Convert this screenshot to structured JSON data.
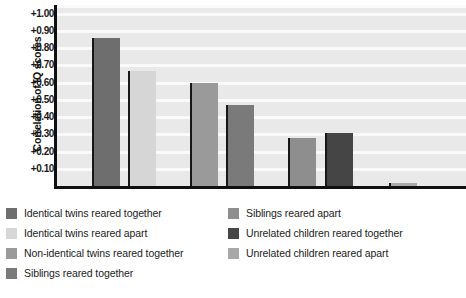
{
  "chart_data": {
    "type": "bar",
    "title": "",
    "xlabel": "",
    "ylabel": "Correlation of IQ scores",
    "ylim": [
      0.0,
      1.05
    ],
    "grid": true,
    "legend_position": "bottom",
    "ytick_labels": [
      "+1.00",
      "+0.90",
      "+0.80",
      "+0.70",
      "+0.60",
      "+0.50",
      "+0.40",
      "+0.30",
      "+0.20",
      "+0.10"
    ],
    "ytick_values": [
      1.0,
      0.9,
      0.8,
      0.7,
      0.6,
      0.5,
      0.4,
      0.3,
      0.2,
      0.1
    ],
    "categories": [
      "Identical twins reared together",
      "Identical twins reared apart",
      "Non-identical twins reared together",
      "Siblings reared together",
      "Siblings reared apart",
      "Unrelated children reared together",
      "Unrelated children reared apart"
    ],
    "values": [
      0.86,
      0.67,
      0.6,
      0.47,
      0.28,
      0.31,
      0.02
    ],
    "colors": [
      "#6e6e6e",
      "#d6d6d6",
      "#9a9a9a",
      "#7a7a7a",
      "#8e8e8e",
      "#454545",
      "#a8a8a8"
    ],
    "bar_x_px": [
      92,
      128,
      190,
      226,
      288,
      325,
      389
    ],
    "bar_w_px": [
      28,
      28,
      28,
      28,
      28,
      28,
      28
    ],
    "plot_bg": "#e9e9e9",
    "gridline_color": "#fafafa",
    "axis_color": "#101010"
  },
  "legend": {
    "left_column": [
      {
        "label": "Identical twins reared together",
        "color": "#6e6e6e"
      },
      {
        "label": "Identical twins reared apart",
        "color": "#d6d6d6"
      },
      {
        "label": "Non-identical twins reared together",
        "color": "#9a9a9a"
      },
      {
        "label": "Siblings reared together",
        "color": "#7a7a7a"
      }
    ],
    "right_column": [
      {
        "label": "Siblings reared apart",
        "color": "#8e8e8e"
      },
      {
        "label": "Unrelated children reared together",
        "color": "#454545"
      },
      {
        "label": "Unrelated children reared apart",
        "color": "#a8a8a8"
      }
    ]
  }
}
